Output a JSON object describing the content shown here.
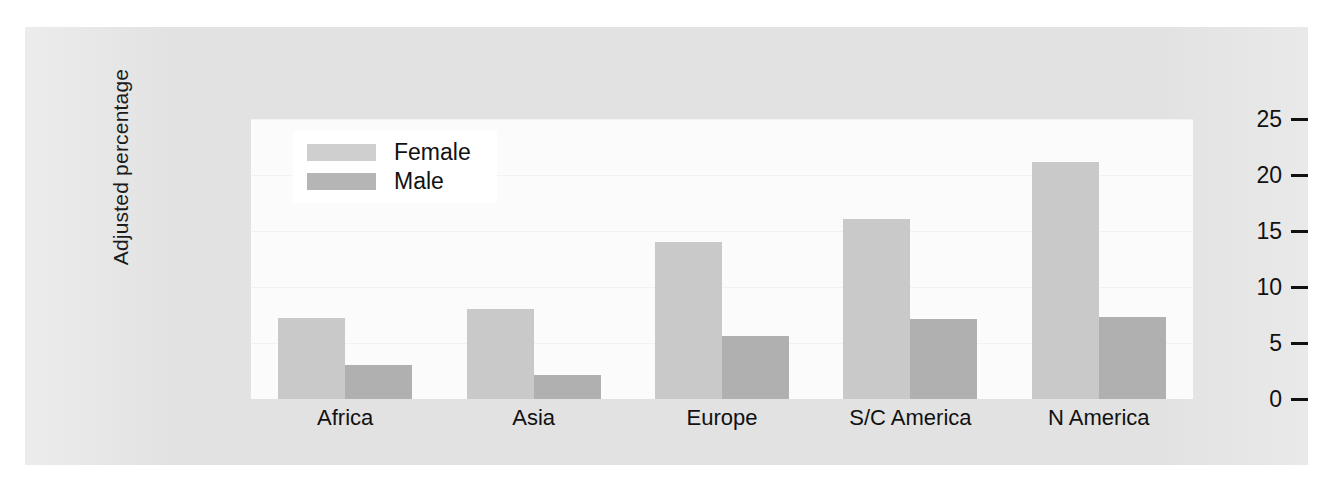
{
  "chart_data": {
    "type": "bar",
    "title": "",
    "subtitle": "",
    "xlabel": "",
    "ylabel": "Adjusted percentage",
    "ylim": [
      0,
      25
    ],
    "yticks": [
      "0",
      "5",
      "10",
      "15",
      "20",
      "25"
    ],
    "ytick_values": [
      0,
      5,
      10,
      15,
      20,
      25
    ],
    "grid": true,
    "legend_position": "top-left inside plot",
    "categories": [
      "Africa",
      "Asia",
      "Europe",
      "S/C America",
      "N America"
    ],
    "series": [
      {
        "name": "Female",
        "color": "#c9c9c9",
        "values": [
          7.2,
          8.0,
          14.0,
          16.1,
          21.2
        ]
      },
      {
        "name": "Male",
        "color": "#b0b0b0",
        "values": [
          3.0,
          2.1,
          5.6,
          7.1,
          7.3
        ]
      }
    ]
  },
  "legend": {
    "items": [
      {
        "label": "Female"
      },
      {
        "label": "Male"
      }
    ]
  },
  "colors": {
    "female_bar": "#c9c9c9",
    "male_bar": "#b0b0b0",
    "plot_background": "#fbfbfb",
    "figure_background": "#e2e2e2",
    "page_background": "#ffffff",
    "text": "#111111"
  }
}
